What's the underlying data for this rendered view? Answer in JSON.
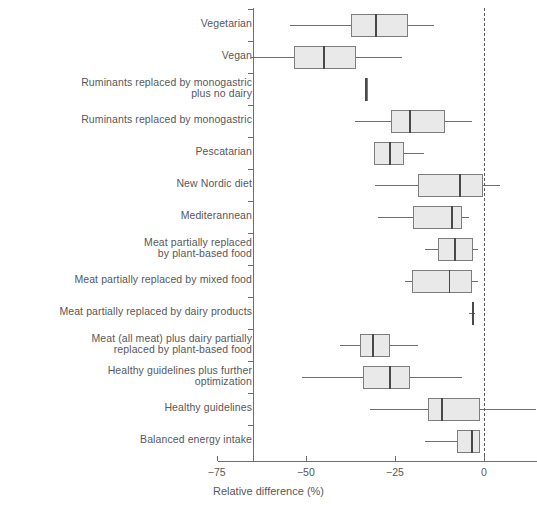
{
  "chart_data": {
    "type": "box",
    "title": "",
    "xlabel": "Relative difference (%)",
    "ylabel": "",
    "xlim": [
      -78,
      2
    ],
    "xticks": [
      -75,
      -50,
      -25,
      0
    ],
    "xticklabels": [
      "−75",
      "−50",
      "−25",
      "0"
    ],
    "grid": false,
    "legend": "none",
    "reference_line": {
      "value": 0,
      "style": "dashed"
    },
    "categories": [
      "Vegetarian",
      "Vegan",
      "Ruminants replaced by monogastric\nplus no dairy",
      "Ruminants replaced by monogastric",
      "Pescatarian",
      "New Nordic diet",
      "Mediterannean",
      "Meat partially replaced\nby plant-based food",
      "Meat partially replaced by mixed food",
      "Meat partially replaced by dairy products",
      "Meat (all meat) plus dairy partially\nreplaced by plant-based food",
      "Healthy guidelines plus further\noptimization",
      "Healthy guidelines",
      "Balanced energy intake"
    ],
    "boxes": [
      {
        "label": "Vegetarian",
        "whisker_low": -54.5,
        "q1": -37.4,
        "median": -30.3,
        "q3": -21.3,
        "whisker_high": -14.0
      },
      {
        "label": "Vegan",
        "whisker_low": -65.5,
        "q1": -53.4,
        "median": -44.9,
        "q3": -35.9,
        "whisker_high": -23.0
      },
      {
        "label": "Ruminants replaced by monogastric plus no dairy",
        "whisker_low": -33.4,
        "q1": -33.2,
        "median": -33.1,
        "q3": -32.9,
        "whisker_high": -32.7
      },
      {
        "label": "Ruminants replaced by monogastric",
        "whisker_low": -36.2,
        "q1": -26.1,
        "median": -20.8,
        "q3": -10.9,
        "whisker_high": -3.4
      },
      {
        "label": "Pescatarian",
        "whisker_low": -30.9,
        "q1": -30.9,
        "median": -26.4,
        "q3": -22.5,
        "whisker_high": -16.9
      },
      {
        "label": "New Nordic diet",
        "whisker_low": -30.6,
        "q1": -18.5,
        "median": -6.7,
        "q3": -0.3,
        "whisker_high": 4.5
      },
      {
        "label": "Mediterannean",
        "whisker_low": -29.8,
        "q1": -19.9,
        "median": -9.0,
        "q3": -6.2,
        "whisker_high": -4.2
      },
      {
        "label": "Meat partially replaced by plant-based food",
        "whisker_low": -16.6,
        "q1": -12.9,
        "median": -8.1,
        "q3": -3.1,
        "whisker_high": -1.7
      },
      {
        "label": "Meat partially replaced by mixed food",
        "whisker_low": -22.2,
        "q1": -20.2,
        "median": -9.6,
        "q3": -3.4,
        "whisker_high": -1.7
      },
      {
        "label": "Meat partially replaced by dairy products",
        "whisker_low": -4.2,
        "q1": -3.4,
        "median": -3.1,
        "q3": -2.8,
        "whisker_high": -2.5
      },
      {
        "label": "Meat (all meat) plus dairy partially replaced by plant-based food",
        "whisker_low": -40.4,
        "q1": -34.8,
        "median": -31.2,
        "q3": -26.4,
        "whisker_high": -18.5
      },
      {
        "label": "Healthy guidelines plus further optimization",
        "whisker_low": -51.1,
        "q1": -34.0,
        "median": -26.4,
        "q3": -20.8,
        "whisker_high": -6.2
      },
      {
        "label": "Healthy guidelines",
        "whisker_low": -32.0,
        "q1": -15.7,
        "median": -11.8,
        "q3": -1.1,
        "whisker_high": 14.6
      },
      {
        "label": "Balanced energy intake",
        "whisker_low": -16.6,
        "q1": -7.6,
        "median": -3.4,
        "q3": -1.1,
        "whisker_high": -1.1
      }
    ]
  },
  "geometry": {
    "plot_left": 484,
    "px_per_unit": 3.563,
    "row_top": 25,
    "row_step": 32,
    "box_height": 23,
    "axis_y": 461,
    "label_right_edge": 252,
    "colors": {
      "box_fill": "#e9e9e9",
      "box_stroke": "#7d7d7f",
      "median": "#49494b",
      "axis": "#6e6e70",
      "text": "#58585a"
    }
  }
}
